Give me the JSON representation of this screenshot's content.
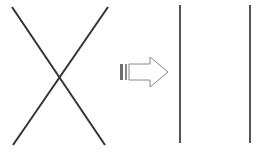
{
  "figure": {
    "title": "",
    "background_color": "#ffffff",
    "width": 263,
    "height": 154
  },
  "left_shape": {
    "name": "crossing-lines-x",
    "label": "",
    "stroke_color": "#333333",
    "stroke_width": 2,
    "segments": [
      {
        "name": "diagonal-down-right",
        "x1": 12,
        "y1": 7,
        "x2": 105,
        "y2": 145
      },
      {
        "name": "diagonal-down-left",
        "x1": 108,
        "y1": 7,
        "x2": 13,
        "y2": 145
      }
    ],
    "intersection": {
      "x": 60,
      "y": 76
    }
  },
  "arrow": {
    "name": "transformation-arrow",
    "direction": "right",
    "label": "",
    "stroke_color": "#8a8a8a",
    "fill_color": "#ffffff",
    "stroke_width": 1,
    "tail_bars": [
      {
        "x": 120,
        "y": 64,
        "width": 3,
        "height": 16,
        "color": "#6e6e6e"
      },
      {
        "x": 125,
        "y": 64,
        "width": 2,
        "height": 16,
        "color": "#8a8a8a"
      }
    ],
    "body": {
      "x": 129,
      "y": 64,
      "shaft_height": 16,
      "head_width": 18,
      "head_height": 30,
      "tip_x": 168,
      "center_y": 72
    }
  },
  "right_shape": {
    "name": "parallel-vertical-lines",
    "label": "",
    "stroke_color": "#555555",
    "stroke_width": 2,
    "lines": [
      {
        "name": "vertical-line-left",
        "x1": 180,
        "y1": 5,
        "x2": 180,
        "y2": 143
      },
      {
        "name": "vertical-line-right",
        "x1": 250,
        "y1": 5,
        "x2": 250,
        "y2": 143
      }
    ]
  },
  "chart_data": {
    "type": "diagram",
    "title": "",
    "xlabel": "",
    "ylabel": "",
    "elements": [
      {
        "id": "x-cross",
        "kind": "crossing-lines",
        "count": 2
      },
      {
        "id": "arrow",
        "kind": "arrow",
        "direction": "right"
      },
      {
        "id": "parallel-lines",
        "kind": "vertical-lines",
        "count": 2
      }
    ]
  }
}
